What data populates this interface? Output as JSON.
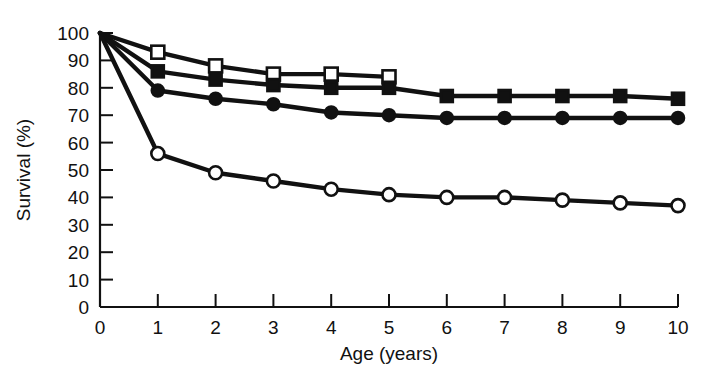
{
  "chart_data": {
    "type": "line",
    "title": "",
    "subtitle": "",
    "xlabel": "Age (years)",
    "ylabel": "Survival (%)",
    "xlim": [
      0,
      10
    ],
    "ylim": [
      0,
      100
    ],
    "grid": false,
    "legend": "none",
    "xticks": [
      0,
      1,
      2,
      3,
      4,
      5,
      6,
      7,
      8,
      9,
      10
    ],
    "xtick_labels": [
      "0",
      "1",
      "2",
      "3",
      "4",
      "5",
      "6",
      "7",
      "8",
      "9",
      "10"
    ],
    "yticks": [
      0,
      10,
      20,
      30,
      40,
      50,
      60,
      70,
      80,
      90,
      100
    ],
    "ytick_labels": [
      "0",
      "10",
      "20",
      "30",
      "40",
      "50",
      "60",
      "70",
      "80",
      "90",
      "100"
    ],
    "line_color": "#111111",
    "series": [
      {
        "name": "open-square-series",
        "marker": "open-square",
        "marker_fill": "#ffffff",
        "marker_edge": "#111111",
        "x": [
          0,
          1,
          2,
          3,
          4,
          5
        ],
        "values": [
          100,
          93,
          88,
          85,
          85,
          84
        ]
      },
      {
        "name": "filled-square-series",
        "marker": "filled-square",
        "marker_fill": "#111111",
        "marker_edge": "#111111",
        "x": [
          0,
          1,
          2,
          3,
          4,
          5,
          6,
          7,
          8,
          9,
          10
        ],
        "values": [
          100,
          86,
          83,
          81,
          80,
          80,
          77,
          77,
          77,
          77,
          76
        ]
      },
      {
        "name": "filled-circle-series",
        "marker": "filled-circle",
        "marker_fill": "#111111",
        "marker_edge": "#111111",
        "x": [
          0,
          1,
          2,
          3,
          4,
          5,
          6,
          7,
          8,
          9,
          10
        ],
        "values": [
          100,
          79,
          76,
          74,
          71,
          70,
          69,
          69,
          69,
          69,
          69
        ]
      },
      {
        "name": "open-circle-series",
        "marker": "open-circle",
        "marker_fill": "#ffffff",
        "marker_edge": "#111111",
        "x": [
          0,
          1,
          2,
          3,
          4,
          5,
          6,
          7,
          8,
          9,
          10
        ],
        "values": [
          100,
          56,
          49,
          46,
          43,
          41,
          40,
          40,
          39,
          38,
          37
        ]
      }
    ]
  }
}
